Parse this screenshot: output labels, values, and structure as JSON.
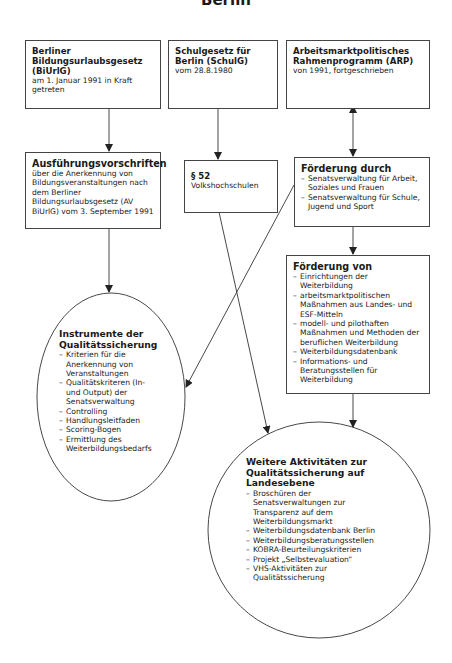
{
  "title": "Berlin",
  "boxes": {
    "biurlg": {
      "heading": "Berliner Bildungsurlaubsgesetz (BiUrlG)",
      "text": "am 1. Januar 1991 in Kraft getreten"
    },
    "schulg": {
      "heading": "Schulgesetz für Berlin (SchulG)",
      "text": "vom 28.8.1980"
    },
    "arp": {
      "heading": "Arbeitsmarktpolitisches Rahmenprogramm (ARP)",
      "text": "von 1991, fortgeschrieben"
    },
    "av": {
      "heading": "Ausführungsvorschriften",
      "text": "über die Anerkennung von Bildungsveranstaltungen nach dem Berliner Bildungsurlaubsgesetz (AV BiUrlG) vom 3. September 1991"
    },
    "p52": {
      "heading": "§ 52",
      "text": "Volkshochschulen"
    },
    "foerderung_durch": {
      "heading": "Förderung durch",
      "items": [
        "Senatsverwaltung für Arbeit, Soziales und Frauen",
        "Senatsverwaltung für Schule, Jugend und Sport"
      ]
    },
    "foerderung_von": {
      "heading": "Förderung von",
      "items": [
        "Einrichtungen der Weiterbildung",
        "arbeitsmarktpolitischen Maßnahmen aus Landes- und ESF-Mitteln",
        "modell- und pilothaften Maßnahmen und Methoden der beruflichen Weiterbildung",
        "Weiterbildungsdatenbank",
        "Informations- und Beratungsstellen für Weiterbildung"
      ]
    }
  },
  "ellipses": {
    "instrumente": {
      "heading": "Instrumente der Qualitätssicherung",
      "items": [
        "Kriterien für die Anerkennung von Veranstaltungen",
        "Qualitätskriteren (In- und Output) der Senatsverwaltung",
        "Controlling",
        "Handlungsleitfaden",
        "Scoring-Bogen",
        "Ermittlung des Weiterbildungsbedarfs"
      ]
    },
    "weitere": {
      "heading": "Weitere Aktivitäten zur Qualitätssicherung auf Landesebene",
      "items": [
        "Broschüren der Senatsverwaltungen zur Transparenz auf dem Weiterbildungsmarkt",
        "Weiterbildungsdatenbank Berlin",
        "Weiterbildungsberatungsstellen",
        "KOBRA-Beurteilungskriterien",
        "Projekt „Selbstevaluation“",
        "VHS-Aktivitäten zur Qualitätssicherung"
      ]
    }
  },
  "colors": {
    "line": "#333333",
    "border": "#444444",
    "background": "#ffffff"
  }
}
